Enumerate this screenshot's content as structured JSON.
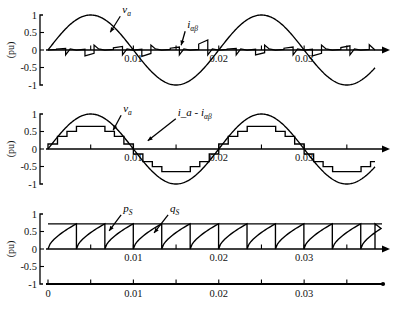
{
  "figure": {
    "background": "#ffffff",
    "stroke_color": "#000000",
    "width": 397,
    "height": 311
  },
  "chart_data": [
    {
      "type": "line",
      "panel": 1,
      "title": "",
      "xlabel": "",
      "ylabel": "(pu)",
      "xlim": [
        0,
        0.0383
      ],
      "ylim": [
        -1.15,
        1.15
      ],
      "xticks": [
        0,
        0.005,
        0.01,
        0.015,
        0.02,
        0.025,
        0.03,
        0.035
      ],
      "xticklabels": [
        "",
        "",
        "0.01",
        "",
        "0.02",
        "",
        "0.03",
        ""
      ],
      "yticks": [
        -1,
        -0.5,
        0,
        0.5,
        1
      ],
      "yticklabels": [
        "-1",
        "-0.5",
        "0",
        "0.5",
        "1"
      ],
      "grid": false,
      "legend_position": "inline-annotation",
      "annotations": [
        {
          "text": "v",
          "sub": "a",
          "x": 0.0087,
          "y": 1.05
        },
        {
          "text": "i",
          "sub": "αβ",
          "x": 0.0163,
          "y": 0.62
        }
      ],
      "series": [
        {
          "name": "v_a",
          "label": "v_a",
          "kind": "sine",
          "amplitude": 1.0,
          "period": 0.02,
          "phase": 0.0,
          "samples": 400
        },
        {
          "name": "i_alphabeta",
          "label": "i_αβ",
          "kind": "ripple-staircase",
          "amplitude": 0.16,
          "segment": 0.00333,
          "values": [
            0.05,
            -0.17,
            0.12,
            -0.18,
            0.1,
            0.34,
            0.05,
            -0.14,
            0.1,
            -0.17,
            0.14,
            0.3
          ]
        }
      ]
    },
    {
      "type": "line",
      "panel": 2,
      "title": "",
      "xlabel": "",
      "ylabel": "(pu)",
      "xlim": [
        0,
        0.0383
      ],
      "ylim": [
        -1.15,
        1.15
      ],
      "xticks": [
        0,
        0.005,
        0.01,
        0.015,
        0.02,
        0.025,
        0.03,
        0.035
      ],
      "xticklabels": [
        "",
        "",
        "0.01",
        "",
        "0.02",
        "",
        "0.03",
        ""
      ],
      "yticks": [
        -1,
        -0.5,
        0,
        0.5,
        1
      ],
      "yticklabels": [
        "-1",
        "-0.5",
        "0",
        "0.5",
        "1"
      ],
      "grid": false,
      "legend_position": "inline-annotation",
      "annotations": [
        {
          "text": "v",
          "sub": "a",
          "x": 0.0088,
          "y": 1.05
        },
        {
          "text": "i_a - i",
          "sub": "αβ",
          "x": 0.0152,
          "y": 0.95
        }
      ],
      "series": [
        {
          "name": "v_a",
          "label": "v_a",
          "kind": "sine",
          "amplitude": 1.0,
          "period": 0.02,
          "phase": 0.0,
          "samples": 400
        },
        {
          "name": "i_a_minus_i_alphabeta",
          "label": "i_a - i_αβ",
          "kind": "staircase",
          "amplitude": 0.62,
          "period": 0.02,
          "steps_per_halfcycle": 9
        }
      ]
    },
    {
      "type": "line",
      "panel": 3,
      "title": "",
      "xlabel": "",
      "ylabel": "(pu)",
      "xlim": [
        0,
        0.0383
      ],
      "ylim": [
        -1.15,
        1.15
      ],
      "xticks": [
        0,
        0.005,
        0.01,
        0.015,
        0.02,
        0.025,
        0.03,
        0.035
      ],
      "xticklabels": [
        "0",
        "",
        "0.01",
        "",
        "0.02",
        "",
        "0.03",
        ""
      ],
      "yticks": [
        -1,
        -0.5,
        0,
        0.5,
        1
      ],
      "yticklabels": [
        "-1",
        "-0.5",
        "0",
        "0.5",
        "1"
      ],
      "grid": false,
      "legend_position": "inline-annotation",
      "annotations": [
        {
          "text": "p",
          "sub": "S",
          "x": 0.0088,
          "y": 1.06
        },
        {
          "text": "q",
          "sub": "S",
          "x": 0.0143,
          "y": 1.06
        }
      ],
      "series": [
        {
          "name": "p_S",
          "label": "p_S",
          "kind": "constant",
          "value": 0.72
        },
        {
          "name": "q_S",
          "label": "q_S",
          "kind": "sawtooth",
          "low": 0.0,
          "high": 0.72,
          "period": 0.00333,
          "curvature": "concave"
        }
      ]
    }
  ],
  "panels": [
    {
      "id": "panel-1",
      "y": 2,
      "height": 100
    },
    {
      "id": "panel-2",
      "y": 101,
      "height": 100
    },
    {
      "id": "panel-3",
      "y": 200,
      "height": 111
    }
  ],
  "axis_labels": {
    "y_unit": "(pu)",
    "y_ticks": [
      "1",
      "0.5",
      "0",
      "-0.5",
      "-1"
    ],
    "x_ticks": [
      "0",
      "0.01",
      "0.02",
      "0.03"
    ]
  }
}
